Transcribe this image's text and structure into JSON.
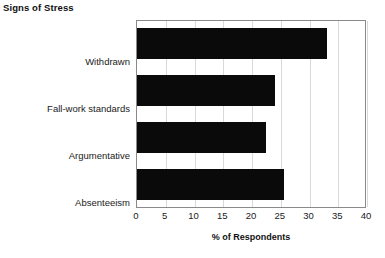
{
  "chart_data": {
    "type": "bar",
    "orientation": "horizontal",
    "title": "Signs of Stress",
    "xlabel": "% of Respondents",
    "ylabel": "",
    "categories": [
      "Withdrawn",
      "Fall-work standards",
      "Argumentative",
      "Absenteeism"
    ],
    "values": [
      33,
      24,
      22.5,
      25.5
    ],
    "xlim": [
      0,
      40
    ],
    "xticks": [
      0,
      5,
      10,
      15,
      20,
      25,
      30,
      35,
      40
    ],
    "xtick_labels": [
      "0",
      "5",
      "10",
      "15",
      "20",
      "25",
      "30",
      "35",
      "40"
    ],
    "grid": true,
    "grid_axis": "x",
    "legend": false,
    "bar_color": "#0a0a0a",
    "frame_color": "#8a8a8a",
    "grid_color": "#d9d9d9"
  }
}
